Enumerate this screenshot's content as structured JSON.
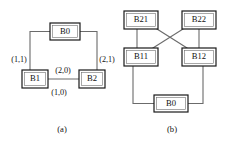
{
  "figure": {
    "width": 227,
    "height": 144,
    "background_color": "#ffffff",
    "line_color": "#6b6b6b",
    "box_border_color": "#1a1a1a",
    "text_color": "#111111"
  },
  "panels": [
    {
      "id": "panel-a",
      "caption": "(a)",
      "caption_pos": {
        "x": 62,
        "y": 130
      },
      "nodes": [
        {
          "id": "a-b0",
          "label": "B0",
          "x": 50,
          "y": 23,
          "w": 30,
          "h": 17
        },
        {
          "id": "a-b1",
          "label": "B1",
          "x": 22,
          "y": 70,
          "w": 26,
          "h": 18
        },
        {
          "id": "a-b2",
          "label": "B2",
          "x": 79,
          "y": 70,
          "w": 26,
          "h": 18
        }
      ],
      "edges": [
        {
          "id": "a-edge-b0-b1",
          "from": "B0",
          "to": "B1",
          "path": "M 50 31.5 L 30 31.5 L 30 70"
        },
        {
          "id": "a-edge-b0-b2",
          "from": "B0",
          "to": "B2",
          "path": "M 80 31.5 L 97 31.5 L 97 70"
        },
        {
          "id": "a-edge-b1-b2",
          "from": "B1",
          "to": "B2",
          "path": "M 48 79 L 79 79"
        }
      ],
      "edge_labels": [
        {
          "id": "a-label-1-1",
          "text": "(1,1)",
          "x": 19,
          "y": 60
        },
        {
          "id": "a-label-2-0",
          "text": "(2,0)",
          "x": 63,
          "y": 71
        },
        {
          "id": "a-label-2-1",
          "text": "(2,1)",
          "x": 107,
          "y": 60
        },
        {
          "id": "a-label-1-0",
          "text": "(1,0)",
          "x": 59,
          "y": 92
        }
      ]
    },
    {
      "id": "panel-b",
      "caption": "(b)",
      "caption_pos": {
        "x": 172,
        "y": 130
      },
      "nodes": [
        {
          "id": "b-b21",
          "label": "B21",
          "x": 124,
          "y": 11,
          "w": 34,
          "h": 18
        },
        {
          "id": "b-b22",
          "label": "B22",
          "x": 182,
          "y": 11,
          "w": 34,
          "h": 18
        },
        {
          "id": "b-b11",
          "label": "B11",
          "x": 124,
          "y": 48,
          "w": 34,
          "h": 18
        },
        {
          "id": "b-b12",
          "label": "B12",
          "x": 182,
          "y": 48,
          "w": 34,
          "h": 18
        },
        {
          "id": "b-b0",
          "label": "B0",
          "x": 154,
          "y": 95,
          "w": 34,
          "h": 17
        }
      ],
      "edges": [
        {
          "id": "b-edge-b21-b11",
          "from": "B21",
          "to": "B11",
          "path": "M 137 29 L 137 48"
        },
        {
          "id": "b-edge-b22-b12",
          "from": "B22",
          "to": "B12",
          "path": "M 199 29 L 199 48"
        },
        {
          "id": "b-edge-b21-b12",
          "from": "B21",
          "to": "B12",
          "path": "M 157 29 L 187 48"
        },
        {
          "id": "b-edge-b22-b11",
          "from": "B22",
          "to": "B11",
          "path": "M 183 29 L 153 48"
        },
        {
          "id": "b-edge-b11-b0",
          "from": "B11",
          "to": "B0",
          "path": "M 133 66 L 133 103.5 L 154 103.5"
        },
        {
          "id": "b-edge-b12-b0",
          "from": "B12",
          "to": "B0",
          "path": "M 203 66 L 203 103.5 L 188 103.5"
        }
      ],
      "edge_labels": []
    }
  ]
}
